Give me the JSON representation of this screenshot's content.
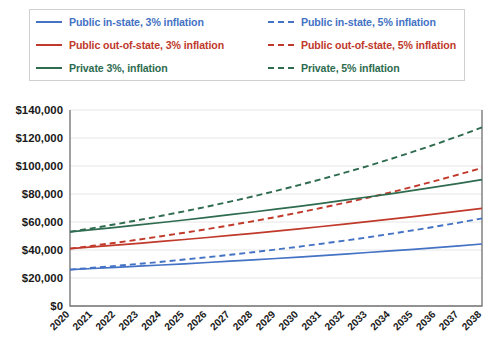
{
  "legend": {
    "items": [
      {
        "label": "Public in-state, 3% inflation",
        "color": "#4472C4",
        "style": "solid",
        "name": "legend-public-instate-3"
      },
      {
        "label": "Public in-state, 5% inflation",
        "color": "#4472C4",
        "style": "dashed",
        "name": "legend-public-instate-5"
      },
      {
        "label": "Public out-of-state, 3% inflation",
        "color": "#C0392B",
        "style": "solid",
        "name": "legend-public-outofstate-3"
      },
      {
        "label": "Public out-of-state, 5% inflation",
        "color": "#C0392B",
        "style": "dashed",
        "name": "legend-public-outofstate-5"
      },
      {
        "label": "Private 3%, inflation",
        "color": "#2E6B4F",
        "style": "solid",
        "name": "legend-private-3"
      },
      {
        "label": "Private, 5% inflation",
        "color": "#2E6B4F",
        "style": "dashed",
        "name": "legend-private-5"
      }
    ]
  },
  "footnote": "",
  "chart_data": {
    "type": "line",
    "title": "",
    "xlabel": "",
    "ylabel": "",
    "ylim": [
      0,
      140000
    ],
    "ytick_step": 20000,
    "ytick_labels": [
      "$0",
      "$20,000",
      "$40,000",
      "$60,000",
      "$80,000",
      "$100,000",
      "$120,000",
      "$140,000"
    ],
    "ytick_values": [
      0,
      20000,
      40000,
      60000,
      80000,
      100000,
      120000,
      140000
    ],
    "grid": true,
    "legend_position": "top",
    "x_rotation": 45,
    "categories": [
      "2020",
      "2021",
      "2022",
      "2023",
      "2024",
      "2025",
      "2026",
      "2027",
      "2028",
      "2029",
      "2030",
      "2031",
      "2032",
      "2033",
      "2034",
      "2035",
      "2036",
      "2037",
      "2038"
    ],
    "series": [
      {
        "name": "Public in-state, 3% inflation",
        "color": "#4472C4",
        "style": "solid",
        "values": [
          26000,
          26780,
          27583,
          28411,
          29263,
          30141,
          31045,
          31977,
          32936,
          33924,
          34942,
          35990,
          37070,
          38182,
          39327,
          40507,
          41722,
          42974,
          44263
        ]
      },
      {
        "name": "Public in-state, 5% inflation",
        "color": "#4472C4",
        "style": "dashed",
        "values": [
          26000,
          27300,
          28665,
          30098,
          31603,
          33183,
          34843,
          36585,
          38414,
          40335,
          42351,
          44469,
          46692,
          49027,
          51478,
          54052,
          56755,
          59593,
          62572
        ]
      },
      {
        "name": "Public out-of-state, 3% inflation",
        "color": "#C0392B",
        "style": "solid",
        "values": [
          41000,
          42230,
          43497,
          44802,
          46146,
          47530,
          48956,
          50425,
          51938,
          53496,
          55101,
          56754,
          58456,
          60210,
          62016,
          63877,
          65793,
          67767,
          69800
        ]
      },
      {
        "name": "Public out-of-state, 5% inflation",
        "color": "#C0392B",
        "style": "dashed",
        "values": [
          41000,
          43050,
          45203,
          47463,
          49836,
          52328,
          54944,
          57691,
          60576,
          63605,
          66785,
          70124,
          73630,
          77312,
          81178,
          85237,
          89499,
          93974,
          98672
        ]
      },
      {
        "name": "Private 3%, inflation",
        "color": "#2E6B4F",
        "style": "solid",
        "values": [
          53000,
          54590,
          56228,
          57915,
          59652,
          61442,
          63285,
          65184,
          67139,
          69153,
          71228,
          73365,
          75566,
          77833,
          80168,
          82573,
          85050,
          87602,
          90230
        ]
      },
      {
        "name": "Private, 5% inflation",
        "color": "#2E6B4F",
        "style": "dashed",
        "values": [
          53000,
          55650,
          58433,
          61354,
          64422,
          67643,
          71025,
          74576,
          78305,
          82221,
          86332,
          90648,
          95181,
          99940,
          104937,
          110184,
          115693,
          121478,
          127552
        ]
      }
    ]
  }
}
